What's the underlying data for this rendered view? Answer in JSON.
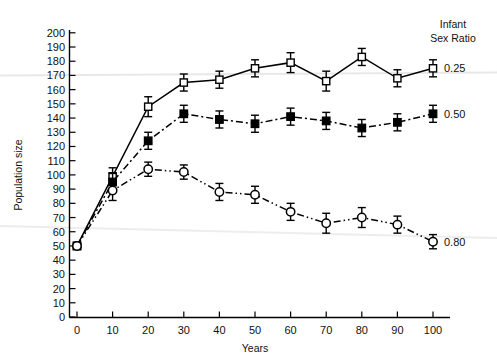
{
  "chart_data": {
    "type": "line",
    "title": "",
    "xlabel": "Years",
    "ylabel": "Population size",
    "xlim": [
      -5,
      110
    ],
    "ylim": [
      0,
      205
    ],
    "x_ticks": [
      0,
      10,
      20,
      30,
      40,
      50,
      60,
      70,
      80,
      90,
      100
    ],
    "y_ticks": [
      0,
      10,
      20,
      30,
      40,
      50,
      60,
      70,
      80,
      90,
      100,
      110,
      120,
      130,
      140,
      150,
      160,
      170,
      180,
      190,
      200
    ],
    "grid": false,
    "legend_position": "right",
    "legend_title_line1": "Infant",
    "legend_title_line2": "Sex Ratio",
    "x": [
      0,
      10,
      20,
      30,
      40,
      50,
      60,
      70,
      80,
      90,
      100
    ],
    "series": [
      {
        "name": "0.25",
        "label": "0.25",
        "marker": "open-square",
        "line_style": "solid",
        "color": "#000000",
        "values": [
          50,
          99,
          148,
          165,
          167,
          175,
          179,
          166,
          183,
          168,
          175
        ],
        "errors": [
          0,
          6,
          7,
          6,
          6,
          6,
          7,
          7,
          6,
          6,
          6
        ]
      },
      {
        "name": "0.50",
        "label": "0.50",
        "marker": "filled-square",
        "line_style": "dash-dot",
        "color": "#000000",
        "values": [
          50,
          95,
          124,
          143,
          139,
          136,
          141,
          138,
          133,
          137,
          143
        ],
        "errors": [
          0,
          6,
          6,
          6,
          6,
          6,
          6,
          6,
          6,
          6,
          6
        ]
      },
      {
        "name": "0.80",
        "label": "0.80",
        "marker": "open-circle",
        "line_style": "dash-dot-dot",
        "color": "#000000",
        "values": [
          50,
          89,
          104,
          102,
          88,
          86,
          74,
          66,
          70,
          65,
          53
        ],
        "errors": [
          0,
          7,
          5,
          5,
          6,
          6,
          6,
          7,
          7,
          6,
          5
        ]
      }
    ]
  },
  "figure": {
    "background": "#ffffff",
    "axis_color": "#000000"
  }
}
